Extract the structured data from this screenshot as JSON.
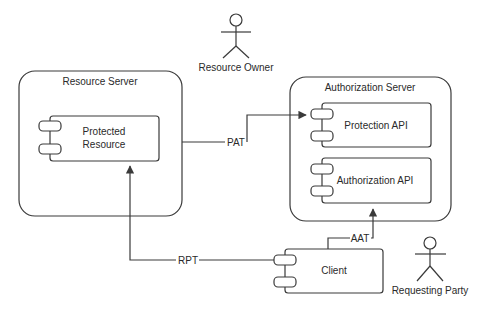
{
  "diagram": {
    "type": "uml-component",
    "colors": {
      "line": "#3a3a3a",
      "text": "#2a2a2a",
      "background": "#ffffff"
    },
    "actors": [
      {
        "id": "resource-owner",
        "label": "Resource Owner"
      },
      {
        "id": "requesting-party",
        "label": "Requesting Party"
      }
    ],
    "containers": [
      {
        "id": "resource-server",
        "label": "Resource Server"
      },
      {
        "id": "authorization-server",
        "label": "Authorization Server"
      }
    ],
    "components": [
      {
        "id": "protected-resource",
        "label_line1": "Protected",
        "label_line2": "Resource",
        "parent": "resource-server"
      },
      {
        "id": "protection-api",
        "label": "Protection API",
        "parent": "authorization-server"
      },
      {
        "id": "authorization-api",
        "label": "Authorization API",
        "parent": "authorization-server"
      },
      {
        "id": "client",
        "label": "Client"
      }
    ],
    "connectors": [
      {
        "id": "pat",
        "label": "PAT",
        "from": "resource-server",
        "to": "protection-api"
      },
      {
        "id": "aat",
        "label": "AAT",
        "from": "client",
        "to": "authorization-api"
      },
      {
        "id": "rpt",
        "label": "RPT",
        "from": "client",
        "to": "protected-resource"
      }
    ]
  }
}
